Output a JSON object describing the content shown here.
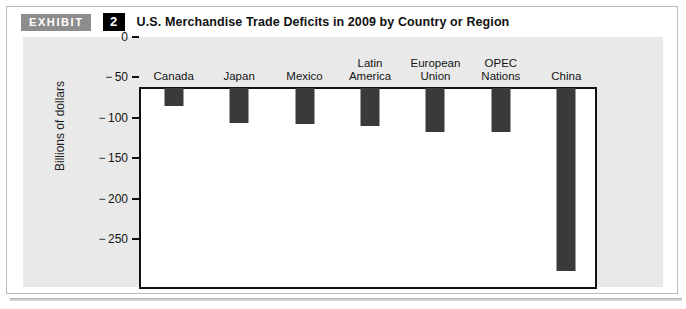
{
  "exhibit": {
    "tag": "EXHIBIT",
    "number": "2",
    "title": "U.S. Merchandise Trade Deficits in 2009 by Country or Region"
  },
  "colors": {
    "bar": "#3a3a3a",
    "panel_background": "#e9e9e9",
    "plot_background": "#ffffff",
    "axis": "#111111",
    "tag_background": "#8d8d8d",
    "number_background": "#000000"
  },
  "chart_data": {
    "type": "bar",
    "title": "U.S. Merchandise Trade Deficits in 2009 by Country or Region",
    "xlabel": "",
    "ylabel": "Billions of dollars",
    "categories": [
      "Canada",
      "Japan",
      "Mexico",
      "Latin\nAmerica",
      "European\nUnion",
      "OPEC\nNations",
      "China"
    ],
    "values": [
      -22,
      -43,
      -45,
      -47,
      -55,
      -55,
      -226
    ],
    "ylim": [
      -250,
      0
    ],
    "yticks": [
      0,
      -50,
      -100,
      -150,
      -200,
      -250
    ],
    "ytick_labels": [
      "0",
      "− 50",
      "− 100",
      "− 150",
      "− 200",
      "− 250"
    ],
    "grid": false,
    "legend": false,
    "orientation": "vertical"
  }
}
